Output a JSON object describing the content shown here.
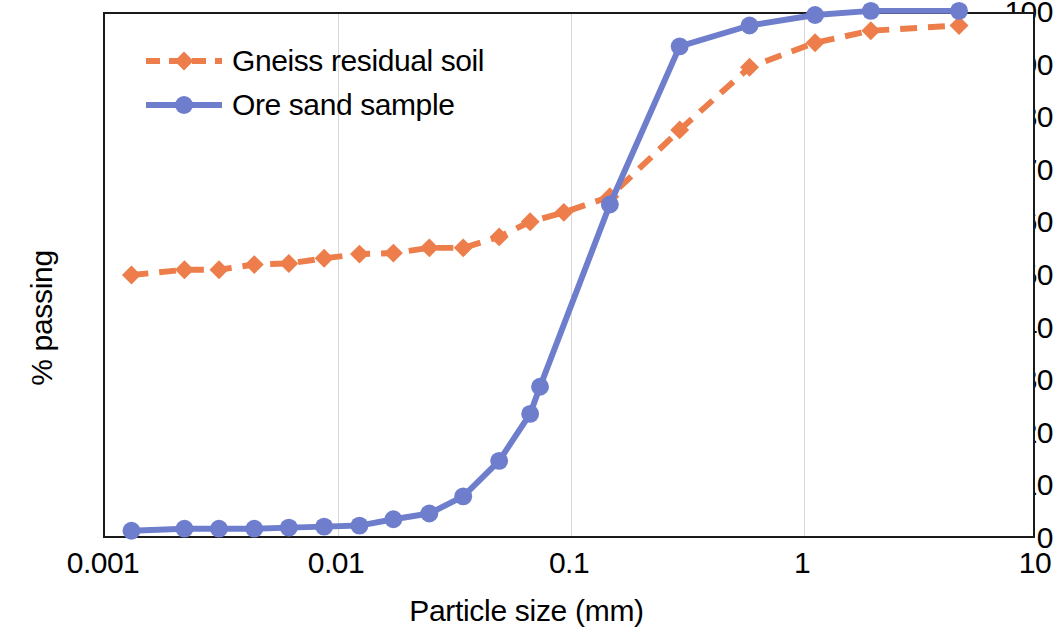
{
  "chart_data": {
    "type": "line",
    "title": "",
    "xlabel": "Particle size (mm)",
    "ylabel": "% passing",
    "xscale": "log",
    "yscale": "linear",
    "xlim": [
      0.001,
      10
    ],
    "ylim": [
      0,
      100
    ],
    "xticks": [
      0.001,
      0.01,
      0.1,
      1,
      10
    ],
    "xtick_labels": [
      "0.001",
      "0.01",
      "0.1",
      "1",
      "10"
    ],
    "yticks": [
      0,
      10,
      20,
      30,
      40,
      50,
      60,
      70,
      80,
      90,
      100
    ],
    "ytick_labels": [
      "0",
      "10",
      "20",
      "30",
      "40",
      "50",
      "60",
      "70",
      "80",
      "90",
      "100"
    ],
    "grid": "vertical-major-only",
    "legend_position": "upper-left-inside",
    "series": [
      {
        "name": "Gneiss residual soil",
        "color": "#ED7D4A",
        "linestyle": "dashed",
        "marker": "diamond",
        "x": [
          0.0013,
          0.0022,
          0.0031,
          0.0044,
          0.0062,
          0.0088,
          0.0125,
          0.0175,
          0.025,
          0.035,
          0.05,
          0.068,
          0.095,
          0.15,
          0.3,
          0.6,
          1.15,
          2.0,
          4.8
        ],
        "y": [
          50.0,
          51.0,
          51.0,
          52.0,
          52.2,
          53.2,
          54.0,
          54.2,
          55.2,
          55.2,
          57.3,
          60.2,
          62.0,
          65.0,
          77.8,
          89.8,
          94.5,
          96.8,
          97.8
        ]
      },
      {
        "name": "Ore sand sample",
        "color": "#6E7ECD",
        "linestyle": "solid",
        "marker": "circle",
        "x": [
          0.0013,
          0.0022,
          0.0031,
          0.0044,
          0.0062,
          0.0088,
          0.0125,
          0.0175,
          0.025,
          0.035,
          0.05,
          0.068,
          0.075,
          0.15,
          0.3,
          0.6,
          1.15,
          2.0,
          4.8
        ],
        "y": [
          1.0,
          1.4,
          1.4,
          1.4,
          1.6,
          1.8,
          2.0,
          3.2,
          4.3,
          7.6,
          14.4,
          23.4,
          28.6,
          63.5,
          93.8,
          97.8,
          99.8,
          100.6,
          100.6
        ]
      }
    ]
  },
  "axes": {
    "y_title": "% passing",
    "x_title": "Particle size (mm)"
  },
  "legend": {
    "entries": [
      {
        "label": "Gneiss residual soil"
      },
      {
        "label": "Ore sand sample"
      }
    ]
  }
}
